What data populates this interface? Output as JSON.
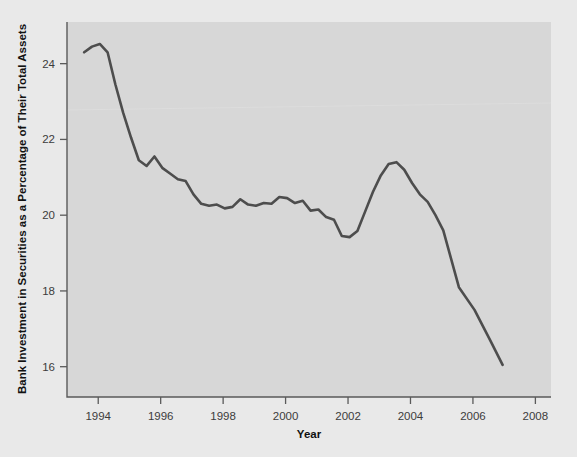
{
  "chart_data": {
    "type": "line",
    "title": "",
    "xlabel": "Year",
    "ylabel": "Bank Investment in Securities as a Percentage of Their Total Assets",
    "xlim": [
      1993.0,
      2008.5
    ],
    "ylim": [
      15.2,
      25.1
    ],
    "xticks": [
      1994,
      1996,
      1998,
      2000,
      2002,
      2004,
      2006,
      2008
    ],
    "xtick_labels": [
      "1994",
      "1996",
      "1998",
      "2000",
      "2002",
      "2004",
      "2006",
      "2008"
    ],
    "yticks": [
      16,
      18,
      20,
      22,
      24
    ],
    "ytick_labels": [
      "16",
      "18",
      "20",
      "22",
      "24"
    ],
    "grid": false,
    "legend": null,
    "line_color": "#4d4d4d",
    "plot_background": "#d7d7d7",
    "figure_background": "#e9e9e9",
    "series": [
      {
        "name": "Bank Investment in Securities as a Percentage of Their Total Assets",
        "x": [
          1993.55,
          1993.8,
          1994.05,
          1994.3,
          1994.55,
          1994.8,
          1995.05,
          1995.3,
          1995.55,
          1995.8,
          1996.05,
          1996.3,
          1996.55,
          1996.8,
          1997.05,
          1997.3,
          1997.55,
          1997.8,
          1998.05,
          1998.3,
          1998.55,
          1998.8,
          1999.05,
          1999.3,
          1999.55,
          1999.8,
          2000.05,
          2000.3,
          2000.55,
          2000.8,
          2001.05,
          2001.3,
          2001.55,
          2001.8,
          2002.05,
          2002.3,
          2002.55,
          2002.8,
          2003.05,
          2003.3,
          2003.55,
          2003.8,
          2004.05,
          2004.3,
          2004.55,
          2004.8,
          2005.05,
          2005.55,
          2006.05,
          2006.55,
          2006.95
        ],
        "values": [
          24.3,
          24.45,
          24.52,
          24.3,
          23.45,
          22.7,
          22.05,
          21.45,
          21.3,
          21.55,
          21.25,
          21.1,
          20.95,
          20.9,
          20.55,
          20.3,
          20.25,
          20.28,
          20.18,
          20.22,
          20.42,
          20.28,
          20.25,
          20.32,
          20.3,
          20.48,
          20.45,
          20.32,
          20.38,
          20.12,
          20.15,
          19.95,
          19.88,
          19.45,
          19.42,
          19.58,
          20.1,
          20.62,
          21.05,
          21.35,
          21.4,
          21.2,
          20.85,
          20.55,
          20.35,
          20.0,
          19.6,
          18.1,
          17.5,
          16.7,
          16.05
        ]
      }
    ],
    "annotations": []
  },
  "geometry": {
    "plot_left": 67,
    "plot_right": 551,
    "plot_top": 22,
    "plot_bottom": 397
  }
}
